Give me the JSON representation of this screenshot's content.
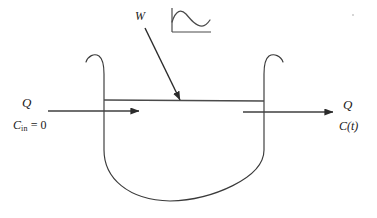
{
  "figure": {
    "type": "process-flow-schematic",
    "background_color": "#ffffff",
    "line_color": "#3a3a3a"
  },
  "labels": {
    "inflow_rate": "Q",
    "inflow_concentration_symbol": "C",
    "inflow_concentration_subscript": "in",
    "inflow_concentration_value": " = 0",
    "outflow_rate": "Q",
    "outflow_concentration": "C(t)",
    "mass_input": "W"
  },
  "inset_chart": {
    "type": "line",
    "title": "",
    "xlabel": "",
    "ylabel": "",
    "grid": false,
    "legend": false,
    "description": "small sketch of concentration response versus time: rises to an early peak, decays to a minimum, then recovers slightly",
    "x": [
      0,
      0.12,
      0.3,
      0.52,
      0.72,
      0.88,
      1.0
    ],
    "y": [
      0.42,
      0.92,
      0.78,
      0.44,
      0.3,
      0.34,
      0.52
    ],
    "xlim": [
      0,
      1
    ],
    "ylim": [
      0,
      1
    ]
  },
  "colors": {
    "ink": "#3a3a3a",
    "ink_dark": "#1a1a1a",
    "paper": "#ffffff",
    "speck": "#c9c9c9"
  }
}
